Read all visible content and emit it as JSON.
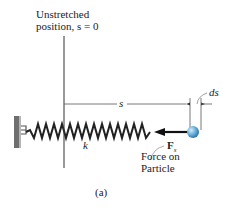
{
  "figure": {
    "caption": "(a)",
    "unstretched_label_line1": "Unstretched",
    "unstretched_label_line2": "position, s = 0",
    "displacement_label": "s",
    "differential_label": "ds",
    "spring_constant_label": "k",
    "force_symbol": "F",
    "force_subscript": "s",
    "force_caption_line1": "Force on",
    "force_caption_line2": "Particle"
  },
  "colors": {
    "line": "#333333",
    "wall": "#777777",
    "particle": "#5aa6d6",
    "arrow": "#111111"
  }
}
